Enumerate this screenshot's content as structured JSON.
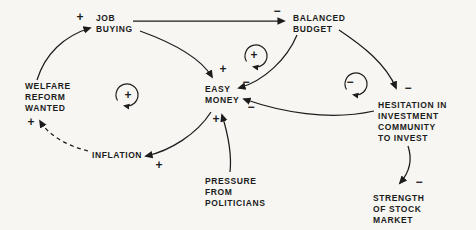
{
  "canvas": {
    "width": 476,
    "height": 230,
    "background": "#f7f6f3",
    "ink": "#1c1c1c"
  },
  "diagram": {
    "nodes": [
      {
        "id": "job-buying",
        "x": 96,
        "y": 13,
        "lines": [
          "JOB",
          "BUYING"
        ]
      },
      {
        "id": "balanced-budget",
        "x": 293,
        "y": 13,
        "lines": [
          "BALANCED",
          "BUDGET"
        ]
      },
      {
        "id": "welfare-reform-wanted",
        "x": 25,
        "y": 81,
        "lines": [
          "WELFARE",
          "REFORM",
          "WANTED"
        ]
      },
      {
        "id": "easy-money",
        "x": 205,
        "y": 84,
        "lines": [
          "EASY",
          "MONEY"
        ]
      },
      {
        "id": "inflation",
        "x": 92,
        "y": 150,
        "lines": [
          "INFLATION"
        ]
      },
      {
        "id": "pressure-from-politicians",
        "x": 205,
        "y": 176,
        "lines": [
          "PRESSURE",
          "FROM",
          "POLITICIANS"
        ]
      },
      {
        "id": "hesitation-investment",
        "x": 378,
        "y": 100,
        "lines": [
          "HESITATION IN",
          "INVESTMENT",
          "COMMUNITY",
          "TO INVEST"
        ]
      },
      {
        "id": "strength-stock-market",
        "x": 373,
        "y": 193,
        "lines": [
          "STRENGTH",
          "OF STOCK",
          "MARKET"
        ]
      }
    ],
    "edges": [
      {
        "id": "welfare-to-job",
        "from": "welfare-reform-wanted",
        "to": "job-buying",
        "polarity": "+",
        "dashed": false,
        "path": "M 37,80 C 45,54 64,36 90,28"
      },
      {
        "id": "job-to-budget",
        "from": "job-buying",
        "to": "balanced-budget",
        "polarity": "−",
        "dashed": false,
        "path": "M 133,21 L 284,21"
      },
      {
        "id": "job-to-easy",
        "from": "job-buying",
        "to": "easy-money",
        "polarity": "+",
        "dashed": false,
        "path": "M 140,31 C 176,44 202,60 212,77"
      },
      {
        "id": "budget-to-easy",
        "from": "balanced-budget",
        "to": "easy-money",
        "polarity": "−",
        "dashed": false,
        "path": "M 297,35 C 287,59 264,81 239,88"
      },
      {
        "id": "budget-to-hesitation",
        "from": "balanced-budget",
        "to": "hesitation-investment",
        "polarity": "−",
        "dashed": false,
        "path": "M 339,30 C 363,46 386,64 396,88"
      },
      {
        "id": "hesitation-to-easy",
        "from": "hesitation-investment",
        "to": "easy-money",
        "polarity": "−",
        "dashed": false,
        "path": "M 374,111 C 329,121 281,112 244,99"
      },
      {
        "id": "pressure-to-easy",
        "from": "pressure-from-politicians",
        "to": "easy-money",
        "polarity": "+",
        "dashed": false,
        "path": "M 230,172 C 232,154 227,131 222,115"
      },
      {
        "id": "easy-to-inflation",
        "from": "easy-money",
        "to": "inflation",
        "polarity": "+",
        "dashed": false,
        "path": "M 211,112 C 197,134 170,151 146,156"
      },
      {
        "id": "inflation-to-welfare",
        "from": "inflation",
        "to": "welfare-reform-wanted",
        "polarity": "+",
        "dashed": true,
        "path": "M 88,151 C 68,146 49,136 40,121"
      },
      {
        "id": "hesitation-to-strength",
        "from": "hesitation-investment",
        "to": "strength-stock-market",
        "polarity": "−",
        "dashed": false,
        "path": "M 408,146 C 413,161 408,174 400,183"
      }
    ],
    "signs": [
      {
        "edge": "welfare-to-job",
        "label": "+",
        "x": 80,
        "y": 17
      },
      {
        "edge": "job-to-budget",
        "label": "−",
        "x": 277,
        "y": 11
      },
      {
        "edge": "job-to-easy",
        "label": "+",
        "x": 223,
        "y": 69
      },
      {
        "edge": "budget-to-easy",
        "label": "−",
        "x": 246,
        "y": 82
      },
      {
        "edge": "hesitation-to-easy",
        "label": "−",
        "x": 251,
        "y": 107
      },
      {
        "edge": "pressure-to-easy",
        "label": "+",
        "x": 216,
        "y": 119
      },
      {
        "edge": "easy-to-inflation",
        "label": "+",
        "x": 159,
        "y": 165
      },
      {
        "edge": "inflation-to-welfare",
        "label": "+",
        "x": 31,
        "y": 122
      },
      {
        "edge": "budget-to-hesitation",
        "label": "−",
        "x": 408,
        "y": 88
      },
      {
        "edge": "hesitation-to-strength",
        "label": "−",
        "x": 419,
        "y": 182
      }
    ],
    "loops": [
      {
        "id": "loop-welfare-job-easy-inflation",
        "sign": "+",
        "cx": 127,
        "cy": 95,
        "r": 11,
        "sdx": 1,
        "sdy": 0
      },
      {
        "id": "loop-job-budget-easy",
        "sign": "+",
        "cx": 256,
        "cy": 56,
        "r": 11,
        "sdx": -2,
        "sdy": -1
      },
      {
        "id": "loop-budget-hesitation-easy",
        "sign": "−",
        "cx": 356,
        "cy": 84,
        "r": 11,
        "sdx": -6,
        "sdy": -2
      }
    ]
  }
}
